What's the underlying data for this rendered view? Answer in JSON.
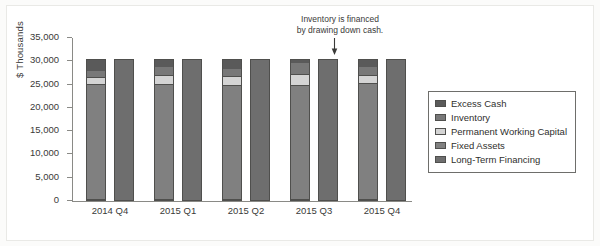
{
  "chart_data": {
    "type": "bar",
    "title": "",
    "xlabel": "",
    "ylabel": "$ Thousands",
    "ylim": [
      0,
      35000
    ],
    "yticks": [
      0,
      5000,
      10000,
      15000,
      20000,
      25000,
      30000,
      35000
    ],
    "ytick_labels": [
      "0",
      "5,000",
      "10,000",
      "15,000",
      "20,000",
      "25,000",
      "30,000",
      "35,000"
    ],
    "grid": false,
    "stacked": true,
    "legend_position": "right",
    "categories": [
      "2014 Q4",
      "2015 Q1",
      "2015 Q2",
      "2015 Q3",
      "2015 Q4"
    ],
    "series": [
      {
        "name": "Fixed Assets",
        "color": "#808080",
        "stack": "assets",
        "values": [
          25000,
          25000,
          24800,
          24800,
          25200
        ]
      },
      {
        "name": "Permanent Working Capital",
        "color": "#d4d4d4",
        "stack": "assets",
        "values": [
          1500,
          2100,
          2000,
          2400,
          1800
        ]
      },
      {
        "name": "Inventory",
        "color": "#787878",
        "stack": "assets",
        "values": [
          1600,
          1800,
          1700,
          2600,
          1900
        ]
      },
      {
        "name": "Excess Cash",
        "color": "#5a5a5a",
        "stack": "assets",
        "values": [
          2400,
          1600,
          2000,
          700,
          1700
        ]
      },
      {
        "name": "Long-Term Financing",
        "color": "#6e6e6e",
        "stack": "financing",
        "values": [
          30500,
          30500,
          30500,
          30500,
          30500
        ]
      }
    ],
    "annotations": [
      {
        "text_line1": "Inventory is financed",
        "text_line2": "by drawing down cash.",
        "points_to": "2015 Q3"
      }
    ]
  },
  "legend": {
    "items": [
      {
        "label": "Excess Cash",
        "color": "#5a5a5a"
      },
      {
        "label": "Inventory",
        "color": "#787878"
      },
      {
        "label": "Permanent Working Capital",
        "color": "#d4d4d4"
      },
      {
        "label": "Fixed Assets",
        "color": "#808080"
      },
      {
        "label": "Long-Term Financing",
        "color": "#6e6e6e"
      }
    ]
  }
}
